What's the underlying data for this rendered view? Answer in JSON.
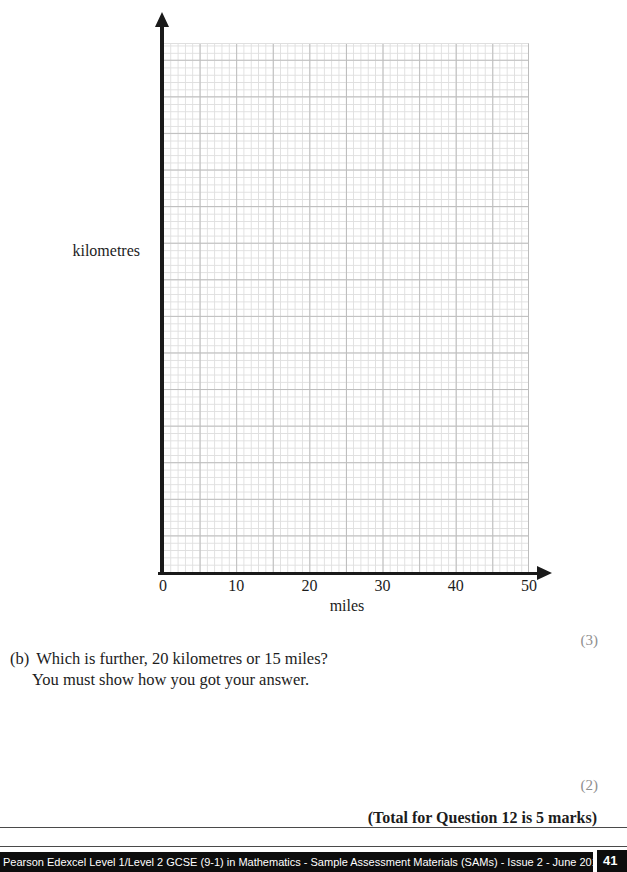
{
  "graph": {
    "y_axis_label": "kilometres",
    "x_axis_label": "miles",
    "x_ticks": [
      "0",
      "10",
      "20",
      "30",
      "40",
      "50"
    ],
    "x_range": [
      0,
      50
    ],
    "grid": "graph-paper, minor squares of 1 mile, major lines every 5 miles, no plotted data"
  },
  "marks": {
    "part_a_marks": "(3)",
    "part_b_marks": "(2)"
  },
  "question": {
    "part_label": "(b)",
    "line1": "Which is further, 20 kilometres or 15 miles?",
    "line2": "You must show how you got your answer.",
    "total_line": "(Total for Question 12 is 5 marks)"
  },
  "footer": {
    "text": "Pearson Edexcel Level 1/Level 2 GCSE (9-1) in Mathematics - Sample Assessment Materials (SAMs) - Issue 2 - June 2015",
    "page_number": "41"
  },
  "colors": {
    "grid_minor": "#dfdfdf",
    "grid_major": "#bdbdbd",
    "axis": "#1a1a1a",
    "ink": "#1c1c1c",
    "marks_gray": "#8f8f8f",
    "footer_bg": "#0d0d0d"
  }
}
